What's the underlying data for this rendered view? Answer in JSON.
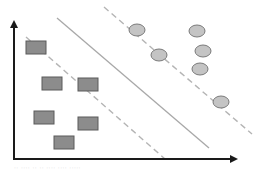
{
  "diagram": {
    "type": "svm-max-margin-classifier",
    "colors": {
      "background": "#ffffff",
      "axis": "#1a1a1a",
      "hyperplane": "#a8a8a8",
      "margin": "#b4b4b4",
      "square_fill": "#8c8c8c",
      "square_stroke": "#5a5a5a",
      "circle_fill": "#c4c4c4",
      "circle_stroke": "#7a7a7a"
    },
    "axes": {
      "origin": [
        14,
        159
      ],
      "x_end": [
        236,
        159
      ],
      "y_end": [
        14,
        22
      ]
    },
    "hyperplane": {
      "from": [
        57,
        18
      ],
      "to": [
        209,
        148
      ]
    },
    "margins": [
      {
        "name": "lower-margin",
        "from": [
          26,
          37
        ],
        "to": [
          165,
          159
        ]
      },
      {
        "name": "upper-margin",
        "from": [
          104,
          7
        ],
        "to": [
          252,
          134
        ]
      }
    ],
    "class_squares": [
      {
        "x": 26,
        "y": 41,
        "w": 20,
        "h": 13
      },
      {
        "x": 42,
        "y": 77,
        "w": 20,
        "h": 13
      },
      {
        "x": 78,
        "y": 78,
        "w": 20,
        "h": 13
      },
      {
        "x": 34,
        "y": 111,
        "w": 20,
        "h": 13
      },
      {
        "x": 78,
        "y": 117,
        "w": 20,
        "h": 13
      },
      {
        "x": 54,
        "y": 136,
        "w": 20,
        "h": 13
      }
    ],
    "class_circles": [
      {
        "cx": 137,
        "cy": 30,
        "rx": 8,
        "ry": 6
      },
      {
        "cx": 197,
        "cy": 31,
        "rx": 8,
        "ry": 6
      },
      {
        "cx": 159,
        "cy": 55,
        "rx": 8,
        "ry": 6
      },
      {
        "cx": 203,
        "cy": 51,
        "rx": 8,
        "ry": 6
      },
      {
        "cx": 200,
        "cy": 69,
        "rx": 8,
        "ry": 6
      },
      {
        "cx": 221,
        "cy": 102,
        "rx": 8,
        "ry": 6
      }
    ]
  },
  "caption": "·· ···· ·· ·· ···· ···· ·····"
}
